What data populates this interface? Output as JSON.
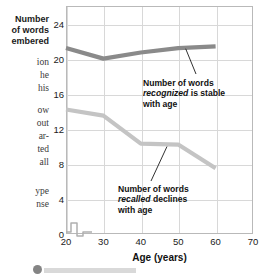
{
  "bleed_text": {
    "lines": [
      {
        "text": "Number",
        "top": 14,
        "bold": true
      },
      {
        "text": "of words",
        "top": 25,
        "bold": true
      },
      {
        "text": "embered",
        "top": 36,
        "bold": true
      },
      {
        "text": "ion",
        "top": 57,
        "bold": false
      },
      {
        "text": "he",
        "top": 70,
        "bold": false
      },
      {
        "text": "his",
        "top": 83,
        "bold": false
      },
      {
        "text": "ow",
        "top": 105,
        "bold": false
      },
      {
        "text": "out",
        "top": 118,
        "bold": false
      },
      {
        "text": "ar-",
        "top": 131,
        "bold": false
      },
      {
        "text": "ted",
        "top": 144,
        "bold": false
      },
      {
        "text": "all",
        "top": 157,
        "bold": false
      },
      {
        "text": "ype",
        "top": 186,
        "bold": false
      },
      {
        "text": "nse",
        "top": 199,
        "bold": false
      }
    ]
  },
  "chart_data": {
    "type": "line",
    "title": "",
    "xlabel": "Age (years)",
    "ylabel": "Number of words remembered",
    "x": [
      20,
      30,
      40,
      50,
      60
    ],
    "xlim": [
      20,
      70
    ],
    "ylim": [
      0,
      26
    ],
    "xticks": [
      20,
      30,
      40,
      50,
      60,
      70
    ],
    "yticks": [
      0,
      4,
      8,
      12,
      16,
      20,
      24
    ],
    "grid": true,
    "legend": "none",
    "axis_break_x": true,
    "series": [
      {
        "name": "recognized",
        "color": "#8a8a8a",
        "values": [
          21.2,
          20.0,
          20.7,
          21.2,
          21.4
        ]
      },
      {
        "name": "recalled",
        "color": "#c4c4c4",
        "values": [
          14.2,
          13.5,
          10.3,
          10.2,
          7.5
        ]
      }
    ],
    "annotations": [
      {
        "id": "recognized-note",
        "lines": [
          "Number of words",
          "recognized is stable",
          "with age"
        ],
        "italic_word": "recognized",
        "text": "Number of words recognized is stable with age",
        "points_to_x": 52,
        "points_to_y": 21.3
      },
      {
        "id": "recalled-note",
        "lines": [
          "Number of words",
          "recalled declines",
          "with age"
        ],
        "italic_word": "recalled",
        "text": "Number of words recalled declines with age",
        "points_to_x": 47,
        "points_to_y": 10.2
      }
    ]
  }
}
